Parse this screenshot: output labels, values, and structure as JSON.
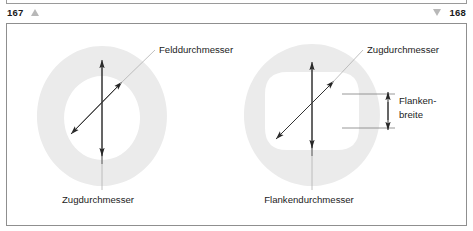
{
  "header": {
    "page_left": "167",
    "page_right": "168",
    "icon_left": "triangle-up-icon",
    "icon_right": "triangle-down-icon"
  },
  "figure": {
    "ring_fill": "#ebebeb",
    "line_color": "#333333",
    "text_color": "#1c1c1c",
    "left_diagram": {
      "shape": "circular-annulus",
      "labels": {
        "diagonal": "Felddurchmesser",
        "vertical": "Zugdurchmesser"
      }
    },
    "right_diagram": {
      "shape": "circle-with-rounded-square-bore",
      "labels": {
        "diagonal": "Zugdurchmesser",
        "vertical": "Flankendurchmesser",
        "bracket_line1": "Flanken-",
        "bracket_line2": "breite"
      }
    }
  }
}
